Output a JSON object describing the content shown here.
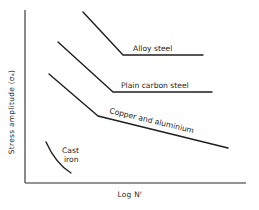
{
  "diagram": {
    "type": "S-N fatigue curves (schematic)",
    "axes": {
      "y_label": "Stress amplitude (σₐ)",
      "x_label": "Log Nᶠ",
      "ticks": "none"
    },
    "curves": [
      {
        "name": "Alloy steel",
        "label": "Alloy steel",
        "shape": "sloped line then horizontal plateau (fatigue limit)",
        "points": [
          [
            83,
            12
          ],
          [
            123,
            55
          ],
          [
            203,
            55
          ]
        ]
      },
      {
        "name": "Plain carbon steel",
        "label": "Plain carbon steel",
        "shape": "sloped line then horizontal plateau (fatigue limit)",
        "points": [
          [
            58,
            42
          ],
          [
            113,
            92
          ],
          [
            212,
            92
          ]
        ]
      },
      {
        "name": "Copper and aluminium",
        "label": "Copper and aluminium",
        "shape": "sloped line then shallower continuing decline (no fatigue limit)",
        "points": [
          [
            49,
            74
          ],
          [
            98,
            116
          ],
          [
            228,
            148
          ]
        ]
      },
      {
        "name": "Cast iron",
        "label_line1": "Cast",
        "label_line2": "iron",
        "shape": "short curved decline at low stress",
        "points": [
          [
            46,
            142
          ],
          [
            58,
            162
          ],
          [
            71,
            173
          ]
        ]
      }
    ],
    "colors": {
      "background": "#ffffff",
      "ink": "#1e1e1e"
    }
  }
}
